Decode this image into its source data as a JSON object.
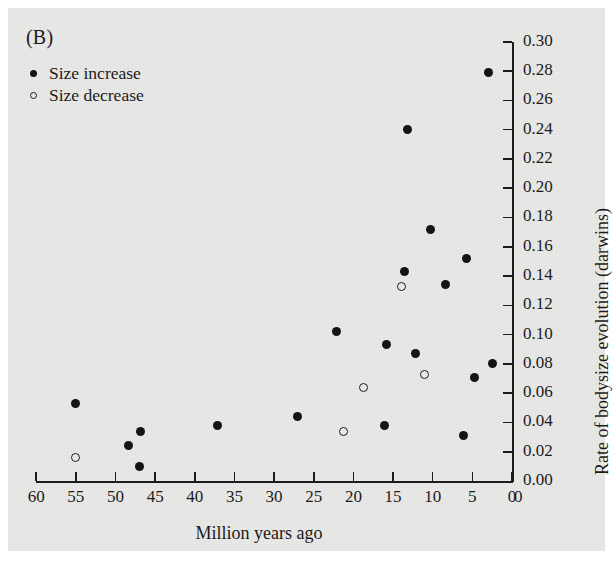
{
  "panel": {
    "label": "(B)"
  },
  "legend": {
    "items": [
      {
        "marker": "filled-circle-icon",
        "label": "Size increase"
      },
      {
        "marker": "open-circle-icon",
        "label": "Size decrease"
      }
    ]
  },
  "axes": {
    "x": {
      "title": "Million years ago",
      "ticks": [
        60,
        55,
        50,
        45,
        40,
        35,
        30,
        25,
        20,
        15,
        10,
        5,
        0
      ],
      "tick_labels": [
        "60",
        "55",
        "50",
        "45",
        "40",
        "35",
        "30",
        "25",
        "20",
        "15",
        "10",
        "5",
        "0"
      ],
      "range": [
        60,
        0
      ],
      "reversed": true
    },
    "y": {
      "title": "Rate of bodysize evolution (darwins)",
      "ticks": [
        0.0,
        0.02,
        0.04,
        0.06,
        0.08,
        0.1,
        0.12,
        0.14,
        0.16,
        0.18,
        0.2,
        0.22,
        0.24,
        0.26,
        0.28,
        0.3
      ],
      "tick_labels": [
        "0.00",
        "0.02",
        "0.04",
        "0.06",
        "0.08",
        "0.10",
        "0.12",
        "0.14",
        "0.16",
        "0.18",
        "0.20",
        "0.22",
        "0.24",
        "0.26",
        "0.28",
        "0.30"
      ],
      "range": [
        0.0,
        0.3
      ],
      "side": "right"
    },
    "origin_label": "0"
  },
  "colors": {
    "background": "#e8e8e6",
    "ink": "#1b1b1b",
    "marker_filled": "#141414",
    "marker_open_fill": "#e9e9e7"
  },
  "chart_data": {
    "type": "scatter",
    "title": "(B)",
    "xlabel": "Million years ago",
    "ylabel": "Rate of bodysize evolution (darwins)",
    "xlim": [
      60,
      0
    ],
    "ylim": [
      0.0,
      0.3
    ],
    "grid": false,
    "legend_position": "top-left",
    "series": [
      {
        "name": "Size increase",
        "marker": "filled-circle",
        "points": [
          {
            "x": 55.0,
            "y": 0.053
          },
          {
            "x": 48.3,
            "y": 0.024
          },
          {
            "x": 47.0,
            "y": 0.01
          },
          {
            "x": 46.8,
            "y": 0.034
          },
          {
            "x": 37.2,
            "y": 0.038
          },
          {
            "x": 27.0,
            "y": 0.044
          },
          {
            "x": 22.1,
            "y": 0.102
          },
          {
            "x": 16.1,
            "y": 0.038
          },
          {
            "x": 15.8,
            "y": 0.093
          },
          {
            "x": 13.6,
            "y": 0.143
          },
          {
            "x": 13.2,
            "y": 0.24
          },
          {
            "x": 12.2,
            "y": 0.087
          },
          {
            "x": 10.3,
            "y": 0.172
          },
          {
            "x": 8.4,
            "y": 0.134
          },
          {
            "x": 6.1,
            "y": 0.031
          },
          {
            "x": 5.8,
            "y": 0.152
          },
          {
            "x": 4.7,
            "y": 0.071
          },
          {
            "x": 3.0,
            "y": 0.279
          },
          {
            "x": 2.4,
            "y": 0.08
          }
        ]
      },
      {
        "name": "Size decrease",
        "marker": "open-circle",
        "points": [
          {
            "x": 55.0,
            "y": 0.016
          },
          {
            "x": 21.2,
            "y": 0.034
          },
          {
            "x": 18.7,
            "y": 0.064
          },
          {
            "x": 13.9,
            "y": 0.133
          },
          {
            "x": 11.0,
            "y": 0.073
          }
        ]
      }
    ]
  }
}
